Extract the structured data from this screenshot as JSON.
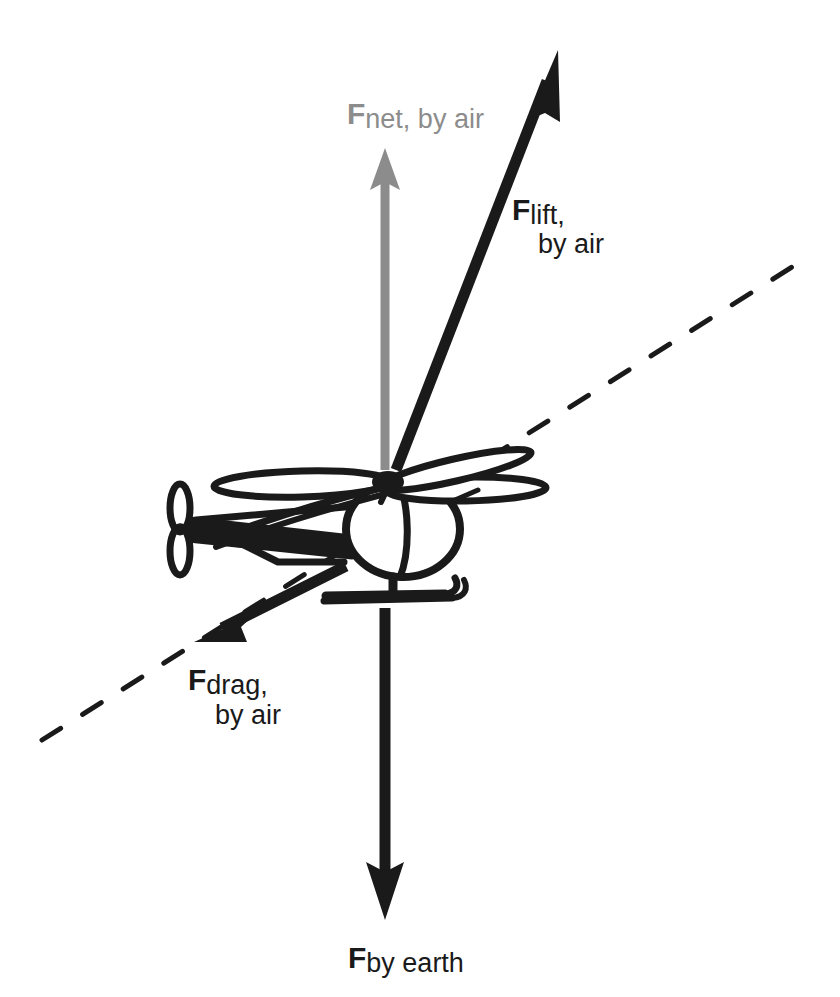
{
  "figure": {
    "kind": "free-body-diagram",
    "background_color": "#ffffff",
    "stroke_color": "#1a1a1a",
    "net_force_color": "#8c8c8c"
  },
  "labels": {
    "net_force": {
      "symbol": "F",
      "subscript": "net, by air",
      "color": "#8c8c8c",
      "lines": [
        "F",
        "net, by air"
      ]
    },
    "lift": {
      "symbol": "F",
      "subscript_line1": "lift,",
      "subscript_line2": "by air",
      "color": "#1a1a1a"
    },
    "drag": {
      "symbol": "F",
      "subscript_line1": "drag,",
      "subscript_line2": "by air",
      "color": "#1a1a1a"
    },
    "weight": {
      "symbol": "F",
      "subscript": "by earth",
      "color": "#1a1a1a"
    }
  },
  "vectors": [
    {
      "name": "net-force-vector",
      "label_key": "net_force",
      "direction": "up",
      "color": "#8c8c8c",
      "tail": [
        385,
        470
      ],
      "tip": [
        385,
        150
      ]
    },
    {
      "name": "lift-vector",
      "label_key": "lift",
      "direction": "up-right",
      "color": "#1a1a1a",
      "tail": [
        396,
        470
      ],
      "tip": [
        558,
        52
      ]
    },
    {
      "name": "drag-vector",
      "label_key": "drag",
      "direction": "down-left",
      "color": "#1a1a1a",
      "tail": [
        345,
        565
      ],
      "tip": [
        196,
        641
      ]
    },
    {
      "name": "weight-vector",
      "label_key": "weight",
      "direction": "down",
      "color": "#1a1a1a",
      "tail": [
        385,
        608
      ],
      "tip": [
        385,
        920
      ]
    }
  ],
  "axis_line": {
    "name": "motion-axis-dashed-line",
    "style": "dashed",
    "start": [
      42,
      740
    ],
    "end": [
      800,
      262
    ],
    "color": "#1a1a1a"
  },
  "helicopter": {
    "name": "helicopter-illustration",
    "body_center": [
      400,
      530
    ],
    "rotor_hub": [
      390,
      480
    ],
    "rotor_span": [
      215,
      545
    ],
    "tail_rotor_center": [
      180,
      528
    ]
  }
}
